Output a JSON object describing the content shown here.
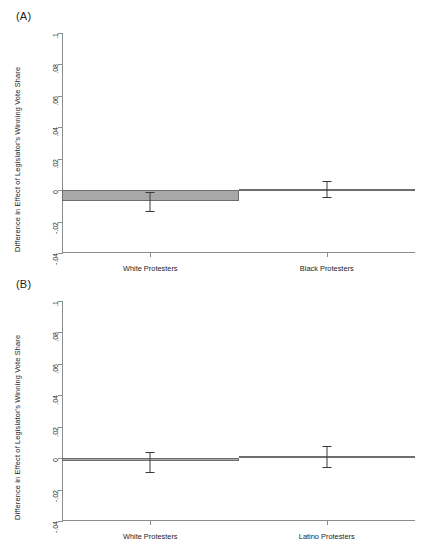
{
  "figure": {
    "panels": [
      {
        "key": "A",
        "label": "(A)",
        "ylabel": "Difference in Effect of Legislator's Winning Vote Share"
      },
      {
        "key": "B",
        "label": "(B)",
        "ylabel": "Difference in Effect of Legislator's Winning Vote Share"
      }
    ],
    "ytick_labels": [
      ".1",
      ".08",
      ".06",
      ".04",
      ".02",
      "0",
      "-.02",
      "-.04"
    ]
  },
  "chart_data": [
    {
      "type": "bar",
      "panel": "(A)",
      "title": "",
      "xlabel": "",
      "ylabel": "Difference in Effect of Legislator's Winning Vote Share",
      "categories": [
        "White Protesters",
        "Black Protesters"
      ],
      "values": [
        -0.007,
        0.0005
      ],
      "errors_low": [
        -0.0132,
        -0.0042
      ],
      "errors_high": [
        -0.0012,
        0.0058
      ],
      "ylim": [
        -0.04,
        0.1
      ],
      "yticks": [
        -0.04,
        -0.02,
        0,
        0.02,
        0.04,
        0.06,
        0.08,
        0.1
      ],
      "ytick_labels": [
        "-.04",
        "-.02",
        "0",
        ".02",
        ".04",
        ".06",
        ".08",
        ".1"
      ],
      "grid": false,
      "legend": "none"
    },
    {
      "type": "bar",
      "panel": "(B)",
      "title": "",
      "xlabel": "",
      "ylabel": "Difference in Effect of Legislator's Winning Vote Share",
      "categories": [
        "White Protesters",
        "Latino Protesters"
      ],
      "values": [
        -0.0018,
        0.0012
      ],
      "errors_low": [
        -0.0088,
        -0.0058
      ],
      "errors_high": [
        0.004,
        0.0076
      ],
      "ylim": [
        -0.04,
        0.1
      ],
      "yticks": [
        -0.04,
        -0.02,
        0,
        0.02,
        0.04,
        0.06,
        0.08,
        0.1
      ],
      "ytick_labels": [
        "-.04",
        "-.02",
        "0",
        ".02",
        ".04",
        ".06",
        ".08",
        ".1"
      ],
      "grid": false,
      "legend": "none"
    }
  ]
}
